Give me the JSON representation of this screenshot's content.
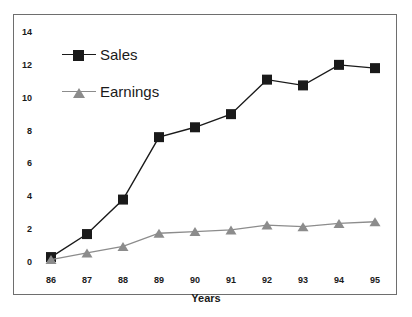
{
  "chart_data": {
    "type": "line",
    "title": "",
    "xlabel": "Years",
    "ylabel": "",
    "categories": [
      "86",
      "87",
      "88",
      "89",
      "90",
      "91",
      "92",
      "93",
      "94",
      "95"
    ],
    "series": [
      {
        "name": "Sales",
        "color": "#1a1a1a",
        "marker": "square",
        "values": [
          0.3,
          1.7,
          3.8,
          7.6,
          8.2,
          9.0,
          11.1,
          10.75,
          12.0,
          11.8
        ]
      },
      {
        "name": "Earnings",
        "color": "#8c8c8c",
        "marker": "triangle",
        "values": [
          0.15,
          0.55,
          0.95,
          1.75,
          1.85,
          1.95,
          2.25,
          2.15,
          2.35,
          2.45
        ]
      }
    ],
    "ylim": [
      0,
      14
    ],
    "yticks": [
      0,
      2,
      4,
      6,
      8,
      10,
      12,
      14
    ],
    "ytick_labels": [
      "0",
      "2",
      "4",
      "6",
      "8",
      "10",
      "12",
      "14"
    ],
    "xtick_labels": [
      "86",
      "87",
      "88",
      "89",
      "90",
      "91",
      "92",
      "93",
      "94",
      "95"
    ],
    "grid": false,
    "legend_position": "upper-left",
    "legend": [
      "Sales",
      "Earnings"
    ],
    "frame_color": "#6e6e6e",
    "background": "#ffffff"
  },
  "legend": {
    "sales_label": "Sales",
    "earnings_label": "Earnings"
  },
  "axis": {
    "x_title": "Years"
  }
}
